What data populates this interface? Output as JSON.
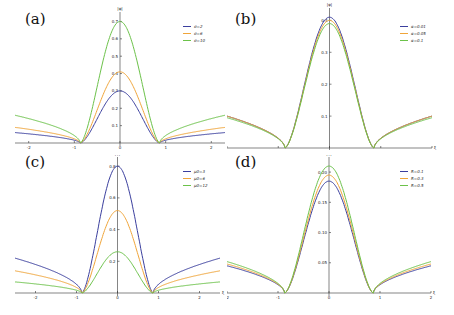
{
  "colors": {
    "series1": "#3b3f9e",
    "series2": "#f0a53a",
    "series3": "#6cc24a",
    "axis": "#333333"
  },
  "chart_data": [
    {
      "panel": "(a)",
      "type": "line",
      "xlabel": "ξ",
      "ylabel": "|φ|",
      "xlim": [
        -2.3,
        2.3
      ],
      "ylim": [
        0,
        0.72
      ],
      "xticks": [
        "-2",
        "-1",
        "0",
        "1",
        "2"
      ],
      "yticks": [
        "0.1",
        "0.2",
        "0.3",
        "0.4",
        "0.5",
        "0.6",
        "0.7"
      ],
      "series": [
        {
          "name": "σ=2",
          "peak": 0.3,
          "edge": 0.06
        },
        {
          "name": "σ=6",
          "peak": 0.41,
          "edge": 0.09
        },
        {
          "name": "σ=10",
          "peak": 0.7,
          "edge": 0.16
        }
      ]
    },
    {
      "panel": "(b)",
      "type": "line",
      "xlabel": "ξ",
      "ylabel": "|φ|",
      "xlim": [
        -2,
        2
      ],
      "ylim": [
        0,
        0.42
      ],
      "xticks": [
        "-2",
        "-1",
        "0",
        "1",
        "2"
      ],
      "yticks": [
        "0.1",
        "0.2",
        "0.3",
        "0.4"
      ],
      "series": [
        {
          "name": "α=0.01",
          "peak": 0.41,
          "edge": 0.1
        },
        {
          "name": "α=0.05",
          "peak": 0.4,
          "edge": 0.1
        },
        {
          "name": "α=0.1",
          "peak": 0.39,
          "edge": 0.095
        }
      ]
    },
    {
      "panel": "(c)",
      "type": "line",
      "xlabel": "ξ",
      "ylabel": "|φ|",
      "xlim": [
        -2.5,
        2.5
      ],
      "ylim": [
        0,
        0.82
      ],
      "xticks": [
        "-2",
        "-1",
        "0",
        "1",
        "2"
      ],
      "yticks": [
        "0.2",
        "0.4",
        "0.6",
        "0.8"
      ],
      "series": [
        {
          "name": "μ0=3",
          "peak": 0.8,
          "edge": 0.22
        },
        {
          "name": "μ0=6",
          "peak": 0.52,
          "edge": 0.14
        },
        {
          "name": "μ0=12",
          "peak": 0.26,
          "edge": 0.07
        }
      ]
    },
    {
      "panel": "(d)",
      "type": "line",
      "xlabel": "ξ",
      "ylabel": "|φ|",
      "xlim": [
        -2,
        2
      ],
      "ylim": [
        0,
        0.215
      ],
      "xticks": [
        "-2",
        "-1",
        "0",
        "1",
        "2"
      ],
      "yticks": [
        "0.05",
        "0.10",
        "0.15",
        "0.20"
      ],
      "series": [
        {
          "name": "R=0.1",
          "peak": 0.185,
          "edge": 0.045
        },
        {
          "name": "R=0.3",
          "peak": 0.195,
          "edge": 0.048
        },
        {
          "name": "R=0.5",
          "peak": 0.21,
          "edge": 0.052
        }
      ]
    }
  ],
  "panels": [
    {
      "label": "(a)",
      "legend": [
        "σ=2",
        "σ=6",
        "σ=10"
      ]
    },
    {
      "label": "(b)",
      "legend": [
        "α=0.01",
        "α=0.05",
        "α=0.1"
      ]
    },
    {
      "label": "(c)",
      "legend": [
        "μ0=3",
        "μ0=6",
        "μ0=12"
      ]
    },
    {
      "label": "(d)",
      "legend": [
        "R=0.1",
        "R=0.3",
        "R=0.5"
      ]
    }
  ]
}
